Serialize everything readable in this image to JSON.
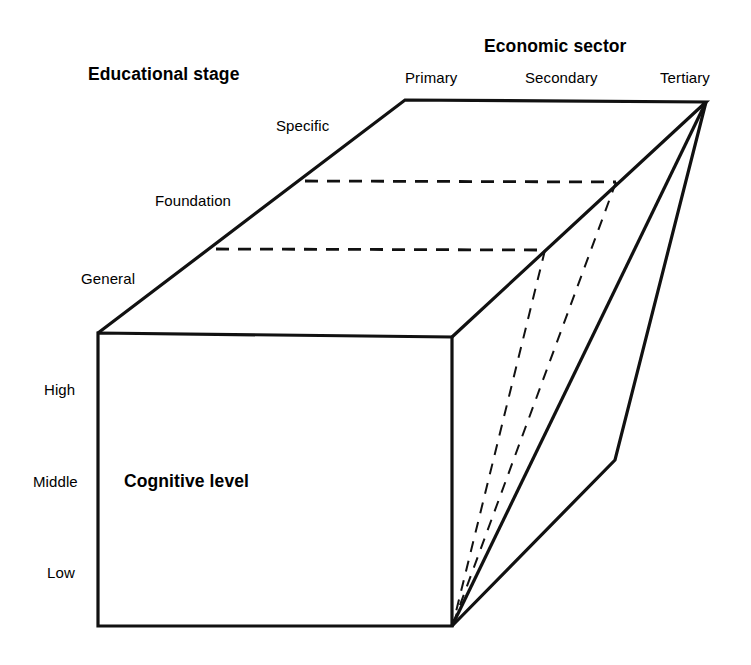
{
  "diagram": {
    "type": "3d-cuboid-model",
    "shape": "cuboid",
    "background_color": "#ffffff",
    "line_color": "#111111",
    "axes": [
      {
        "id": "educational-stage",
        "title": "Educational stage",
        "orientation": "depth-left",
        "categories": [
          "General",
          "Foundation",
          "Specific"
        ]
      },
      {
        "id": "economic-sector",
        "title": "Economic sector",
        "orientation": "horizontal-top",
        "categories": [
          "Primary",
          "Secondary",
          "Tertiary"
        ]
      },
      {
        "id": "cognitive-level",
        "title": "Cognitive level",
        "orientation": "vertical-front",
        "categories": [
          "High",
          "Middle",
          "Low"
        ]
      }
    ]
  },
  "titles": {
    "educational_stage": "Educational stage",
    "economic_sector": "Economic sector",
    "cognitive_level": "Cognitive level"
  },
  "educational_stage_labels": {
    "specific": "Specific",
    "foundation": "Foundation",
    "general": "General"
  },
  "economic_sector_labels": {
    "primary": "Primary",
    "secondary": "Secondary",
    "tertiary": "Tertiary"
  },
  "cognitive_level_labels": {
    "high": "High",
    "middle": "Middle",
    "low": "Low"
  }
}
